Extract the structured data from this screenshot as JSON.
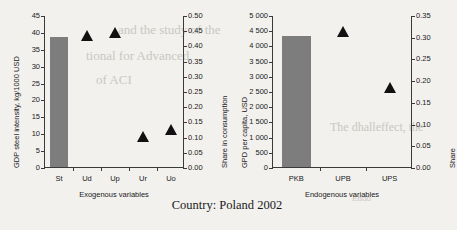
{
  "caption": "Country: Poland 2002",
  "bleed_text": [
    {
      "text": "and the study of the",
      "x": 118,
      "y": 22,
      "size": 13
    },
    {
      "text": "tional for  Advanced",
      "x": 86,
      "y": 48,
      "size": 13
    },
    {
      "text": "of ACI",
      "x": 96,
      "y": 72,
      "size": 13
    },
    {
      "text": "The dhalleffect, the",
      "x": 330,
      "y": 120,
      "size": 12
    },
    {
      "text": "Endo",
      "x": 352,
      "y": 193,
      "size": 9
    }
  ],
  "chart_data": [
    {
      "type": "bar",
      "panel": "left",
      "title": "",
      "xlabel": "Exogenous variables",
      "ylabel": "GDP steel intensity, kg/1000 USD",
      "y2label": "Share in consumption",
      "categories": [
        "St",
        "Ud",
        "Up",
        "Ur",
        "Uo"
      ],
      "ylim": [
        0,
        45
      ],
      "yticks": [
        0,
        5,
        10,
        15,
        20,
        25,
        30,
        35,
        40,
        45
      ],
      "ytick_labels": [
        "0",
        "5",
        "10",
        "15",
        "20",
        "25",
        "30",
        "35",
        "40",
        "45"
      ],
      "y2lim": [
        0.0,
        0.5
      ],
      "y2ticks": [
        0.0,
        0.05,
        0.1,
        0.15,
        0.2,
        0.25,
        0.3,
        0.35,
        0.4,
        0.45,
        0.5
      ],
      "y2tick_labels": [
        "0.00",
        "0.05",
        "0.10",
        "0.15",
        "0.20",
        "0.25",
        "0.30",
        "0.35",
        "0.40",
        "0.45",
        "0.50"
      ],
      "grid": false,
      "legend": "none",
      "series": [
        {
          "name": "GDP steel intensity",
          "mark": "bar",
          "axis": "left",
          "color": "#7d7d7d",
          "values": [
            38.6,
            null,
            null,
            null,
            null
          ]
        },
        {
          "name": "Share in consumption",
          "mark": "triangle",
          "axis": "right",
          "color": "#111111",
          "values": [
            null,
            0.435,
            0.445,
            0.105,
            0.128
          ]
        }
      ]
    },
    {
      "type": "bar",
      "panel": "right",
      "title": "",
      "xlabel": "Endogenous variables",
      "ylabel": "GPD per capita, USD",
      "y2label": "Share",
      "categories": [
        "PKB",
        "UPB",
        "UPS"
      ],
      "ylim": [
        0,
        5000
      ],
      "yticks": [
        0,
        500,
        1000,
        1500,
        2000,
        2500,
        3000,
        3500,
        4000,
        4500,
        5000
      ],
      "ytick_labels": [
        "0",
        "500",
        "1 000",
        "1 500",
        "2 000",
        "2 500",
        "3 000",
        "3 500",
        "4 000",
        "4 500",
        "5 000"
      ],
      "y2lim": [
        0.0,
        0.35
      ],
      "y2ticks": [
        0.0,
        0.05,
        0.1,
        0.15,
        0.2,
        0.25,
        0.3,
        0.35
      ],
      "y2tick_labels": [
        "0.00",
        "0.05",
        "0.10",
        "0.15",
        "0.20",
        "0.25",
        "0.30",
        "0.35"
      ],
      "grid": false,
      "legend": "none",
      "series": [
        {
          "name": "GPD per capita",
          "mark": "bar",
          "axis": "left",
          "color": "#7d7d7d",
          "values": [
            4300,
            null,
            null
          ]
        },
        {
          "name": "Share",
          "mark": "triangle",
          "axis": "right",
          "color": "#111111",
          "values": [
            null,
            0.315,
            0.186
          ]
        }
      ]
    }
  ]
}
